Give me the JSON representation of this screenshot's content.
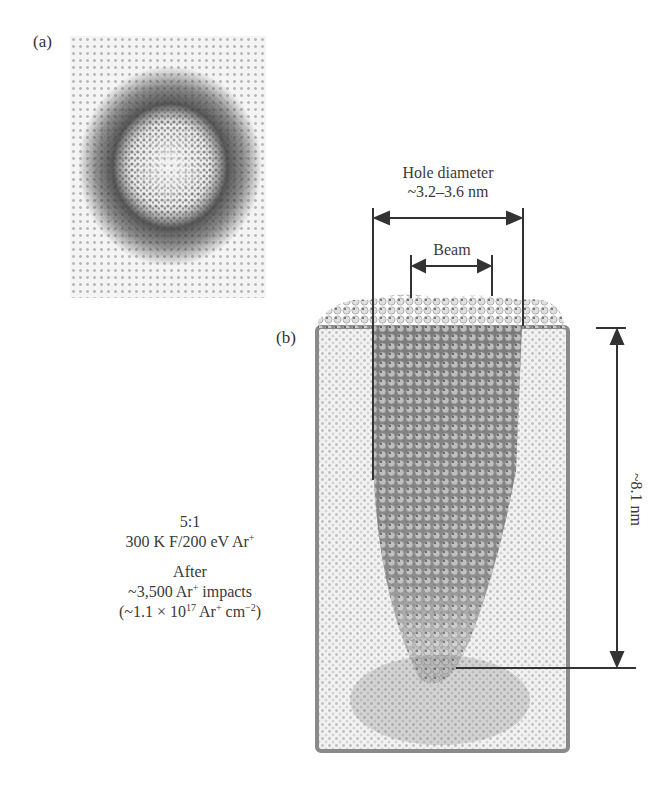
{
  "figure": {
    "panel_a": {
      "label": "(a)"
    },
    "panel_b": {
      "label": "(b)"
    },
    "annotations": {
      "hole_diameter_title": "Hole diameter",
      "hole_diameter_value": "~3.2–3.6 nm",
      "beam_label": "Beam",
      "depth_label": "~8.1 nm"
    },
    "caption": {
      "ratio": "5:1",
      "conditions_prefix": "300 K F/200 eV Ar",
      "conditions_sup": "+",
      "after": "After",
      "impacts_prefix": "~3,500 Ar",
      "impacts_sup": "+",
      "impacts_suffix": " impacts",
      "fluence_prefix": "(~1.1 × 10",
      "fluence_exp": "17",
      "fluence_mid": " Ar",
      "fluence_sup": "+",
      "fluence_unit": " cm",
      "fluence_unit_exp": "−2",
      "fluence_close": ")"
    },
    "colors": {
      "ink": "#3a3a3a",
      "atom_dark": "#3c3c3c",
      "lattice": "#bdbdbd",
      "background": "#ffffff"
    }
  }
}
